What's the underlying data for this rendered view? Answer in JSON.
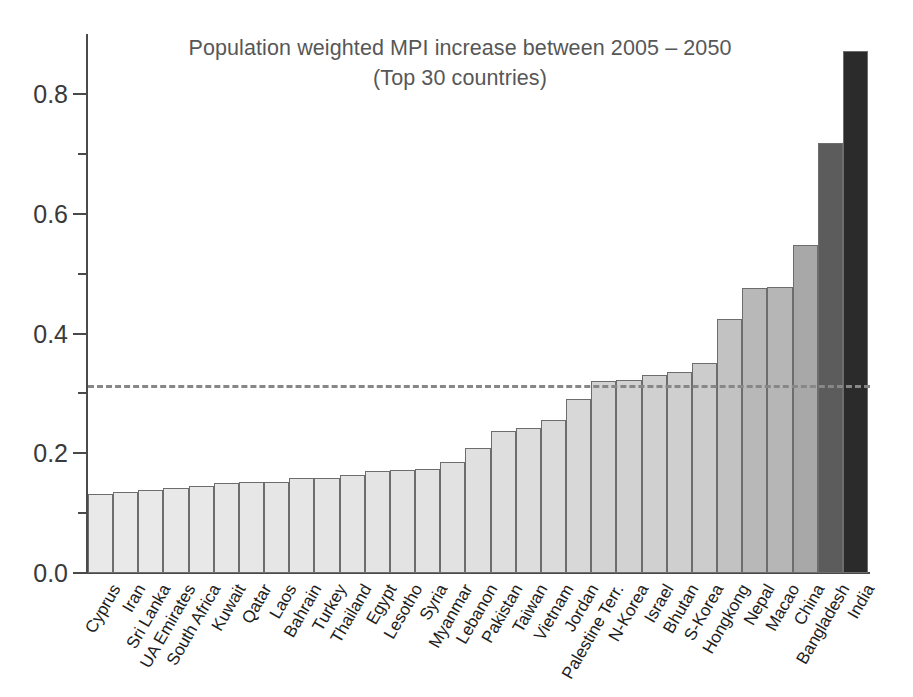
{
  "chart_data": {
    "type": "bar",
    "title": "Population weighted MPI increase between 2005 – 2050",
    "subtitle": "(Top 30 countries)",
    "xlabel": "",
    "ylabel": "",
    "ylim": [
      0.0,
      0.9
    ],
    "grid": false,
    "legend": "none",
    "y_ticks": [
      {
        "label": "0.0",
        "value": 0.0
      },
      {
        "label": "0.2",
        "value": 0.2
      },
      {
        "label": "0.4",
        "value": 0.4
      },
      {
        "label": "0.6",
        "value": 0.6
      },
      {
        "label": "0.8",
        "value": 0.8
      }
    ],
    "y_minor_ticks": [
      0.1,
      0.3,
      0.5,
      0.7
    ],
    "categories": [
      "Cyprus",
      "Iran",
      "Sri Lanka",
      "UA Emirates",
      "South Africa",
      "Kuwait",
      "Qatar",
      "Laos",
      "Bahrain",
      "Turkey",
      "Thailand",
      "Egypt",
      "Lesotho",
      "Syria",
      "Myanmar",
      "Lebanon",
      "Pakistan",
      "Taiwan",
      "Vietnam",
      "Jordan",
      "Palestine Terr.",
      "N-Korea",
      "Israel",
      "Bhutan",
      "S-Korea",
      "Hongkong",
      "Nepal",
      "Macao",
      "China",
      "Bangladesh",
      "India"
    ],
    "values": [
      0.132,
      0.136,
      0.138,
      0.142,
      0.146,
      0.15,
      0.152,
      0.152,
      0.158,
      0.159,
      0.163,
      0.17,
      0.172,
      0.173,
      0.186,
      0.208,
      0.237,
      0.243,
      0.255,
      0.291,
      0.32,
      0.323,
      0.33,
      0.336,
      0.35,
      0.424,
      0.476,
      0.477,
      0.547,
      0.718,
      0.872
    ],
    "bar_colors": [
      "#e9e9e9",
      "#e9e9e9",
      "#e9e9e9",
      "#e8e8e8",
      "#e8e8e8",
      "#e7e7e7",
      "#e7e7e7",
      "#e6e6e6",
      "#e6e6e6",
      "#e5e5e5",
      "#e5e5e5",
      "#e4e4e4",
      "#e3e3e3",
      "#e3e3e3",
      "#e2e2e2",
      "#e0e0e0",
      "#dedede",
      "#dddddd",
      "#dbdbdb",
      "#d8d8d8",
      "#d3d3d3",
      "#d2d2d2",
      "#d0d0d0",
      "#cfcfcf",
      "#cccccc",
      "#c2c2c2",
      "#b8b8b8",
      "#b6b6b6",
      "#a8a8a8",
      "#5c5c5c",
      "#2b2b2b"
    ],
    "reference_line": {
      "value": 0.314,
      "style": "dashed",
      "color": "#878787"
    }
  }
}
